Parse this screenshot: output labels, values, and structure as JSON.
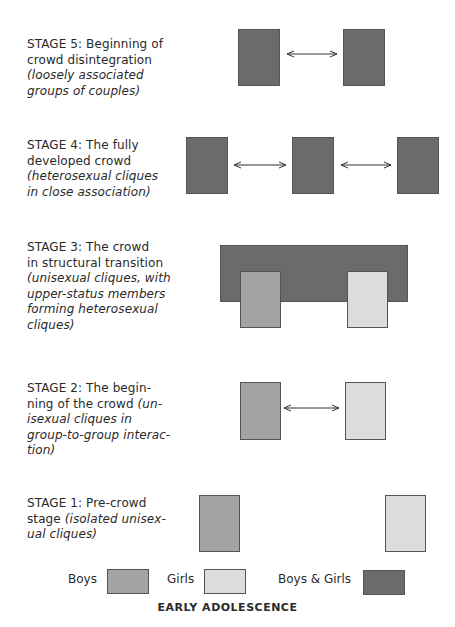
{
  "stages": [
    {
      "title": "STAGE 5: Beginning of crowd disintegration",
      "line1": "STAGE 5: Beginning of",
      "line2": "crowd disintegration",
      "desc1": "(loosely associated",
      "desc2": "groups of couples)"
    },
    {
      "title": "STAGE 4: The fully developed crowd",
      "line1": "STAGE 4: The fully",
      "line2": "developed crowd",
      "desc1": "(heterosexual cliques",
      "desc2": "in close association)"
    },
    {
      "title": "STAGE 3: The crowd in structural transition",
      "line1": "STAGE 3: The crowd",
      "line2": "in structural transition",
      "desc1": "(unisexual cliques, with",
      "desc2": "upper-status members",
      "desc3": "forming heterosexual",
      "desc4": "cliques)"
    },
    {
      "title": "STAGE 2: The beginning of the crowd",
      "line1": "STAGE 2: The begin-",
      "line2a": "ning of the crowd ",
      "line2b": "(un-",
      "desc1": "isexual cliques in",
      "desc2": "group-to-group interac-",
      "desc3": "tion)"
    },
    {
      "title": "STAGE 1: Pre-crowd stage",
      "line1": "STAGE 1: Pre-crowd",
      "line2a": "stage ",
      "line2b": "(isolated unisex-",
      "desc1": "ual cliques)"
    }
  ],
  "legend": {
    "boys": "Boys",
    "girls": "Girls",
    "both": "Boys & Girls"
  },
  "colors": {
    "boys_and_girls": "#6b6b6b",
    "boys": "#a4a4a4",
    "girls": "#dcdcdc"
  },
  "footer": "EARLY ADOLESCENCE"
}
